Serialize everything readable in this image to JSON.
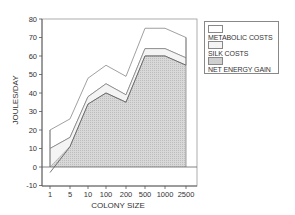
{
  "chart_data": {
    "type": "area",
    "title": "",
    "xlabel": "COLONY SIZE",
    "ylabel": "JOULES/DAY",
    "categories": [
      "1",
      "5",
      "10",
      "100",
      "200",
      "500",
      "1000",
      "2500"
    ],
    "ylim": [
      -10,
      80
    ],
    "yticks": [
      -10,
      0,
      10,
      20,
      30,
      40,
      50,
      60,
      70,
      80
    ],
    "grid": false,
    "legend_position": "right",
    "series": [
      {
        "name": "METABOLIC COSTS",
        "values": [
          20,
          26,
          48,
          55,
          49,
          75,
          75,
          70
        ],
        "fill": "#ffffff"
      },
      {
        "name": "SILK COSTS",
        "values": [
          10,
          16,
          38,
          45,
          39,
          64,
          64,
          59
        ],
        "fill": "#f4f4f4"
      },
      {
        "name": "NET ENERGY GAIN",
        "values": [
          -3,
          11,
          34,
          40,
          35,
          60,
          60,
          55
        ],
        "fill": "#cfcfcf"
      }
    ]
  },
  "legend": {
    "items": [
      {
        "label": "METABOLIC COSTS",
        "fill": "#ffffff"
      },
      {
        "label": "SILK COSTS",
        "fill": "#f4f4f4"
      },
      {
        "label": "NET ENERGY GAIN",
        "fill": "#cfcfcf"
      }
    ]
  }
}
